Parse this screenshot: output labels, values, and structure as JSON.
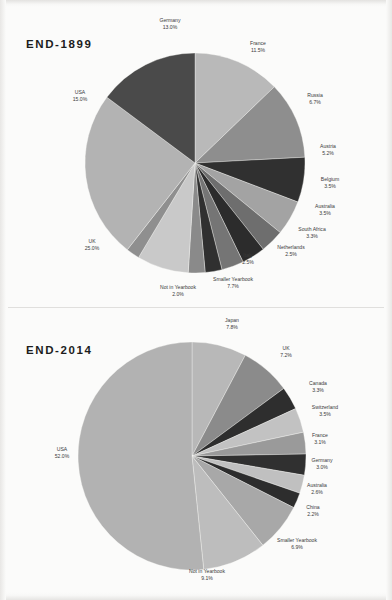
{
  "document": {
    "kind": "grayscale-scanned-page",
    "background_color": "#fbfbfa",
    "text_color": "#3a3a3a"
  },
  "panels": [
    {
      "id": "end-1899",
      "title": "END-1899"
    },
    {
      "id": "end-2014",
      "title": "END-2014"
    }
  ],
  "chart_data": [
    {
      "type": "pie",
      "title": "END-1899",
      "legend": "none",
      "labels_position": "outside-with-leader-free",
      "start_angle_deg": -90,
      "direction": "clockwise",
      "categories": [
        "Germany",
        "France",
        "Russia",
        "Austria",
        "Belgium",
        "Australia",
        "South Africa",
        "Netherlands",
        "Italy",
        "Smaller Yearbook",
        "Not in Yearbook",
        "UK",
        "USA"
      ],
      "values": [
        13.0,
        11.5,
        6.7,
        5.2,
        3.5,
        3.5,
        3.3,
        2.5,
        2.5,
        7.7,
        2.0,
        25.0,
        15.0
      ],
      "value_labels": [
        "13.0%",
        "11.5%",
        "6.7%",
        "5.2%",
        "3.5%",
        "3.5%",
        "3.3%",
        "2.5%",
        "2.5%",
        "7.7%",
        "2.0%",
        "25.0%",
        "15.0%"
      ],
      "colors": [
        "#b9b9b9",
        "#8e8e8e",
        "#303030",
        "#a3a3a3",
        "#6e6e6e",
        "#2c2c2c",
        "#757575",
        "#303030",
        "#8a8a8a",
        "#c9c9c9",
        "#8f8f8f",
        "#b3b3b3",
        "#4a4a4a"
      ],
      "unit": "%"
    },
    {
      "type": "pie",
      "title": "END-2014",
      "legend": "none",
      "labels_position": "outside-with-leader-free",
      "start_angle_deg": -90,
      "direction": "clockwise",
      "categories": [
        "Japan",
        "UK",
        "Canada",
        "Switzerland",
        "France",
        "Germany",
        "Australia",
        "China",
        "Smaller Yearbook",
        "Not in Yearbook",
        "USA"
      ],
      "values": [
        7.8,
        7.2,
        3.3,
        3.5,
        3.1,
        3.0,
        2.6,
        2.2,
        6.9,
        9.1,
        52.0
      ],
      "value_labels": [
        "7.8%",
        "7.2%",
        "3.3%",
        "3.5%",
        "3.1%",
        "3.0%",
        "2.6%",
        "2.2%",
        "6.9%",
        "9.1%",
        "52.0%"
      ],
      "colors": [
        "#b8b8b8",
        "#8b8b8b",
        "#2e2e2e",
        "#c2c2c2",
        "#9a9a9a",
        "#303030",
        "#c0c0c0",
        "#2d2d2d",
        "#a8a8a8",
        "#bdbdbd",
        "#b2b2b2"
      ],
      "unit": "%"
    }
  ],
  "chart1_labels": [
    {
      "name": "Germany",
      "value": "13.0%",
      "x": 170,
      "y": 22,
      "anchor": "middle"
    },
    {
      "name": "France",
      "value": "11.5%",
      "x": 258,
      "y": 45,
      "anchor": "middle"
    },
    {
      "name": "Russia",
      "value": "6.7%",
      "x": 315,
      "y": 97,
      "anchor": "middle"
    },
    {
      "name": "Austria",
      "value": "5.2%",
      "x": 328,
      "y": 148,
      "anchor": "middle"
    },
    {
      "name": "Belgium",
      "value": "3.5%",
      "x": 330,
      "y": 181,
      "anchor": "middle"
    },
    {
      "name": "Australia",
      "value": "3.5%",
      "x": 325,
      "y": 208,
      "anchor": "middle"
    },
    {
      "name": "South Africa",
      "value": "3.3%",
      "x": 312,
      "y": 231,
      "anchor": "middle"
    },
    {
      "name": "Netherlands",
      "value": "2.5%",
      "x": 291,
      "y": 249,
      "anchor": "middle"
    },
    {
      "name": "Italy",
      "value": "2.5%",
      "x": 248,
      "y": 257,
      "anchor": "middle"
    },
    {
      "name": "Smaller Yearbook",
      "value": "7.7%",
      "x": 233,
      "y": 281,
      "anchor": "middle"
    },
    {
      "name": "Not in Yearbook",
      "value": "2.0%",
      "x": 178,
      "y": 289,
      "anchor": "middle"
    },
    {
      "name": "UK",
      "value": "25.0%",
      "x": 92,
      "y": 243,
      "anchor": "middle"
    },
    {
      "name": "USA",
      "value": "15.0%",
      "x": 80,
      "y": 94,
      "anchor": "middle"
    }
  ],
  "chart2_labels": [
    {
      "name": "Japan",
      "value": "7.8%",
      "x": 232,
      "y": 322,
      "anchor": "middle"
    },
    {
      "name": "UK",
      "value": "7.2%",
      "x": 286,
      "y": 350,
      "anchor": "middle"
    },
    {
      "name": "Canada",
      "value": "3.3%",
      "x": 318,
      "y": 385,
      "anchor": "middle"
    },
    {
      "name": "Switzerland",
      "value": "3.5%",
      "x": 325,
      "y": 409,
      "anchor": "middle"
    },
    {
      "name": "France",
      "value": "3.1%",
      "x": 320,
      "y": 437,
      "anchor": "middle"
    },
    {
      "name": "Germany",
      "value": "3.0%",
      "x": 322,
      "y": 462,
      "anchor": "middle"
    },
    {
      "name": "Australia",
      "value": "2.6%",
      "x": 317,
      "y": 487,
      "anchor": "middle"
    },
    {
      "name": "China",
      "value": "2.2%",
      "x": 313,
      "y": 509,
      "anchor": "middle"
    },
    {
      "name": "Smaller Yearbook",
      "value": "6.9%",
      "x": 297,
      "y": 542,
      "anchor": "middle"
    },
    {
      "name": "Not in Yearbook",
      "value": "9.1%",
      "x": 207,
      "y": 573,
      "anchor": "middle"
    },
    {
      "name": "USA",
      "value": "52.0%",
      "x": 62,
      "y": 451,
      "anchor": "middle"
    }
  ],
  "geometry": {
    "chart1": {
      "cx": 195,
      "cy": 163,
      "r": 110
    },
    "chart2": {
      "cx": 192,
      "cy": 456,
      "r": 114
    }
  }
}
